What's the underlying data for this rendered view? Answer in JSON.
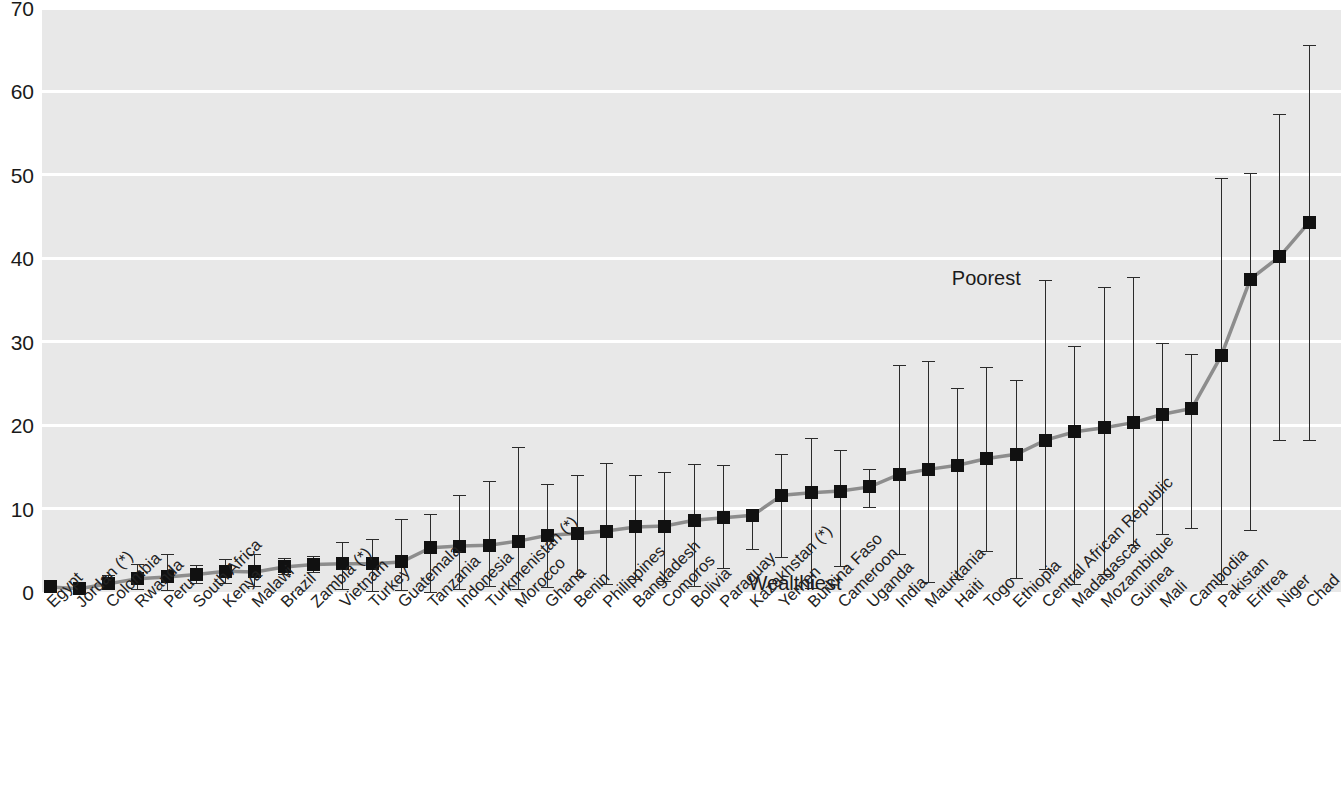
{
  "chart_data": {
    "type": "scatter",
    "title": "",
    "subtitle": "",
    "xlabel": "",
    "ylabel": "",
    "ylim": [
      0,
      70
    ],
    "ytick_labels": [
      "0",
      "10",
      "20",
      "30",
      "40",
      "50",
      "60",
      "70"
    ],
    "ytick_values": [
      0,
      10,
      20,
      30,
      40,
      50,
      60,
      70
    ],
    "grid": "horizontal",
    "legend": "none",
    "annotations": [
      {
        "text": "Poorest",
        "x_index": 33,
        "y": 37.5
      },
      {
        "text": "Wealthiest",
        "x_index": 27,
        "y": 1.0
      }
    ],
    "marker_style": "filled-square",
    "errorbar_meaning": "range from wealthiest to poorest quintile",
    "categories": [
      "Egypt",
      "Jordan (*)",
      "Colombia",
      "Rwanda",
      "Peru",
      "South Africa",
      "Kenya",
      "Malawi",
      "Brazil",
      "Zambia (*)",
      "Vietnam",
      "Turkey",
      "Guatemala",
      "Tanzania",
      "Indonesia",
      "Turkmenistan (*)",
      "Morocco",
      "Ghana",
      "Benin",
      "Philippines",
      "Bangladesh",
      "Comoros",
      "Bolivia",
      "Paraguay",
      "Kazakhstan (*)",
      "Yemen",
      "Burkina Faso",
      "Cameroon",
      "Uganda",
      "India",
      "Mauritania",
      "Haiti",
      "Togo",
      "Ethiopia",
      "Central African Republic",
      "Madagascar",
      "Mozambique",
      "Guinea",
      "Mali",
      "Cambodia",
      "Pakistan",
      "Eritrea",
      "Niger",
      "Chad"
    ],
    "values": [
      0.6,
      0.4,
      1.0,
      1.6,
      1.8,
      2.1,
      2.5,
      2.4,
      3.0,
      3.3,
      3.4,
      3.4,
      3.6,
      5.3,
      5.5,
      5.6,
      6.1,
      6.8,
      7.0,
      7.3,
      7.8,
      7.9,
      8.6,
      8.9,
      9.2,
      11.6,
      11.9,
      12.1,
      12.6,
      14.1,
      14.7,
      15.2,
      16.0,
      16.5,
      18.2,
      19.2,
      19.7,
      20.3,
      21.3,
      22.0,
      28.3,
      37.5,
      40.2,
      44.3
    ],
    "lower_bounds": [
      0.1,
      0.1,
      0.3,
      0.4,
      0.2,
      1.1,
      1.1,
      0.7,
      2.2,
      2.4,
      0.3,
      0.1,
      0.2,
      0.0,
      0.3,
      0.7,
      0.4,
      0.6,
      1.9,
      0.9,
      1.6,
      1.3,
      0.7,
      2.9,
      5.2,
      4.2,
      0.5,
      3.1,
      10.2,
      4.5,
      1.2,
      1.5,
      4.9,
      1.7,
      2.8,
      0.9,
      2.2,
      5.6,
      6.9,
      7.7,
      1.0,
      7.4,
      18.2,
      18.2
    ],
    "upper_bounds": [
      1.3,
      0.9,
      2.0,
      3.3,
      4.6,
      3.2,
      3.9,
      4.5,
      4.1,
      4.3,
      6.0,
      6.4,
      8.8,
      9.3,
      11.6,
      13.3,
      17.4,
      12.9,
      14.0,
      15.5,
      14.0,
      14.4,
      15.3,
      15.2,
      9.6,
      16.6,
      18.4,
      17.0,
      14.7,
      27.2,
      27.7,
      24.5,
      27.0,
      25.4,
      37.4,
      29.5,
      36.5,
      37.7,
      29.8,
      28.5,
      49.6,
      50.2,
      57.3,
      65.6
    ],
    "note_markers": "(*) indicates countries marked with an asterisk in the category labels"
  }
}
